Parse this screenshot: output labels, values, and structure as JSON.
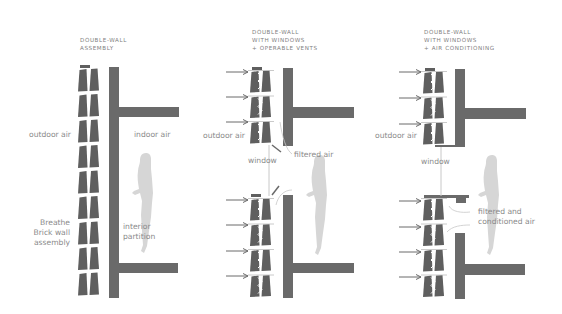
{
  "colors": {
    "wall": "#6a6a6a",
    "brick": "#5f5f5f",
    "person": "#d6d6d6",
    "text": "#8a8a8a",
    "arrow": "#6a6a6a",
    "window": "#c8c8c8"
  },
  "panels": [
    {
      "title_lines": [
        "DOUBLE-WALL",
        "ASSEMBLY"
      ],
      "labels": {
        "outdoor": "outdoor air",
        "indoor": "indoor air",
        "brick_line1": "Breathe",
        "brick_line2": "Brick wall",
        "brick_line3": "assembly",
        "partition_line1": "interior",
        "partition_line2": "partition"
      }
    },
    {
      "title_lines": [
        "DOUBLE-WALL",
        "WITH WINDOWS",
        "+ OPERABLE VENTS"
      ],
      "labels": {
        "outdoor": "outdoor air",
        "window": "window",
        "filtered": "filtered air"
      }
    },
    {
      "title_lines": [
        "DOUBLE-WALL",
        "WITH WINDOWS",
        "+ AIR CONDITIONING"
      ],
      "labels": {
        "outdoor": "outdoor air",
        "window": "window",
        "conditioned_line1": "filtered and",
        "conditioned_line2": "conditioned air"
      }
    }
  ],
  "icons": {
    "arrow": "arrow-right-icon",
    "person": "person-silhouette-icon",
    "brick": "brick-icon"
  }
}
